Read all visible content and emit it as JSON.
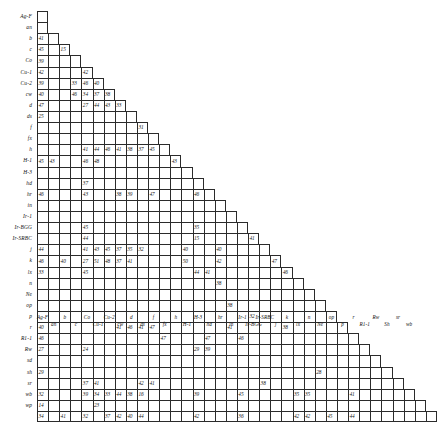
{
  "chart_data": {
    "type": "heatmap",
    "title": "",
    "subtitle": "",
    "xlabel": "",
    "ylabel": "",
    "grid": true,
    "legend": "none",
    "shape": "lower-triangular-staircase",
    "n": 27,
    "note": "Lower-triangular matrix; cell i,j shown only for j <= i. Blank cells carry no value.",
    "labels": [
      "Ag-F",
      "an",
      "b",
      "c",
      "Co",
      "Cu-1",
      "Cu-2",
      "cw",
      "d",
      "ds",
      "f",
      "fx",
      "h",
      "H-1",
      "H-3",
      "hd",
      "hr",
      "in",
      "Ir-1",
      "Ir-BGG",
      "Ir-SRBC",
      "j",
      "k",
      "lx",
      "n",
      "Ne",
      "op"
    ],
    "row_labels": [
      "Ag-F",
      "an",
      "b",
      "c",
      "Co",
      "Cu-1",
      "Cu-2",
      "cw",
      "d",
      "ds",
      "f",
      "fx",
      "h",
      "H-1",
      "H-3",
      "hd",
      "hr",
      "in",
      "Ir-1",
      "Ir-BGG",
      "Ir-SRBC",
      "j",
      "k",
      "lx",
      "n",
      "Ne",
      "op",
      "p",
      "r",
      "R1-1",
      "Rw",
      "sd",
      "sh",
      "sr",
      "wb",
      "wp"
    ],
    "col_labels": [
      "Ag-F",
      "an",
      "b",
      "c",
      "Co",
      "Cu-1",
      "Cu-2",
      "cw",
      "d",
      "ds",
      "f",
      "fx",
      "h",
      "H-1",
      "H-3",
      "hd",
      "hr",
      "in",
      "Ir-1",
      "Ir-BGG",
      "Ir-SRBC",
      "j",
      "k",
      "lx",
      "n",
      "Ne",
      "op",
      "p",
      "r",
      "R1-1",
      "Rw",
      "Sh",
      "sr",
      "wb"
    ],
    "rows": [
      {
        "label": "Ag-F",
        "width": 1,
        "values": [
          null
        ]
      },
      {
        "label": "an",
        "width": 1,
        "values": [
          null
        ]
      },
      {
        "label": "b",
        "width": 2,
        "values": [
          41,
          null
        ]
      },
      {
        "label": "c",
        "width": 3,
        "values": [
          45,
          null,
          15
        ]
      },
      {
        "label": "Co",
        "width": 4,
        "values": [
          39,
          null,
          null,
          null
        ]
      },
      {
        "label": "Cu-1",
        "width": 5,
        "values": [
          42,
          null,
          null,
          null,
          42
        ]
      },
      {
        "label": "Cu-2",
        "width": 6,
        "values": [
          39,
          null,
          null,
          33,
          46,
          40
        ]
      },
      {
        "label": "cw",
        "width": 7,
        "values": [
          40,
          null,
          null,
          46,
          34,
          37,
          38
        ]
      },
      {
        "label": "d",
        "width": 8,
        "values": [
          47,
          null,
          null,
          null,
          27,
          44,
          43,
          33
        ]
      },
      {
        "label": "ds",
        "width": 9,
        "values": [
          25,
          null,
          null,
          null,
          null,
          null,
          null,
          null,
          null
        ]
      },
      {
        "label": "f",
        "width": 10,
        "values": [
          null,
          null,
          null,
          null,
          null,
          null,
          null,
          null,
          null,
          31
        ]
      },
      {
        "label": "fx",
        "width": 11,
        "values": [
          null,
          null,
          null,
          null,
          null,
          null,
          null,
          null,
          null,
          null,
          null
        ]
      },
      {
        "label": "h",
        "width": 12,
        "values": [
          null,
          null,
          null,
          null,
          41,
          44,
          46,
          41,
          38,
          37,
          45,
          null
        ]
      },
      {
        "label": "H-1",
        "width": 13,
        "values": [
          45,
          43,
          null,
          null,
          46,
          48,
          null,
          null,
          null,
          null,
          null,
          null,
          43
        ]
      },
      {
        "label": "H-3",
        "width": 14,
        "values": [
          null,
          null,
          null,
          null,
          null,
          null,
          null,
          null,
          null,
          null,
          null,
          null,
          null,
          null
        ]
      },
      {
        "label": "hd",
        "width": 15,
        "values": [
          null,
          null,
          null,
          null,
          37,
          null,
          null,
          null,
          null,
          null,
          null,
          null,
          null,
          null,
          null
        ]
      },
      {
        "label": "hr",
        "width": 16,
        "values": [
          46,
          null,
          null,
          null,
          43,
          null,
          null,
          38,
          39,
          null,
          47,
          null,
          null,
          null,
          46,
          null
        ]
      },
      {
        "label": "in",
        "width": 17,
        "values": [
          null,
          null,
          null,
          null,
          null,
          null,
          null,
          null,
          null,
          null,
          null,
          null,
          null,
          null,
          null,
          null,
          null
        ]
      },
      {
        "label": "Ir-1",
        "width": 18,
        "values": [
          null,
          null,
          null,
          null,
          null,
          null,
          null,
          null,
          null,
          null,
          null,
          null,
          null,
          null,
          null,
          null,
          null,
          null
        ]
      },
      {
        "label": "Ir-BGG",
        "width": 19,
        "values": [
          null,
          null,
          null,
          null,
          45,
          null,
          null,
          null,
          null,
          null,
          null,
          null,
          null,
          null,
          35,
          null,
          null,
          null,
          null
        ]
      },
      {
        "label": "Ir-SRBC",
        "width": 20,
        "values": [
          null,
          null,
          null,
          null,
          44,
          null,
          null,
          null,
          null,
          null,
          null,
          null,
          null,
          null,
          15,
          null,
          null,
          null,
          null,
          41
        ]
      },
      {
        "label": "j",
        "width": 21,
        "values": [
          44,
          null,
          null,
          null,
          41,
          43,
          45,
          37,
          35,
          32,
          null,
          null,
          null,
          40,
          null,
          null,
          40,
          null,
          null,
          null,
          null
        ]
      },
      {
        "label": "k",
        "width": 22,
        "values": [
          46,
          null,
          40,
          null,
          27,
          51,
          48,
          37,
          41,
          null,
          null,
          null,
          null,
          50,
          null,
          null,
          42,
          null,
          null,
          null,
          null,
          47
        ]
      },
      {
        "label": "lx",
        "width": 23,
        "values": [
          33,
          null,
          null,
          null,
          45,
          null,
          null,
          null,
          null,
          null,
          null,
          null,
          null,
          null,
          44,
          41,
          null,
          null,
          null,
          null,
          null,
          null,
          46
        ]
      },
      {
        "label": "n",
        "width": 24,
        "values": [
          null,
          null,
          null,
          null,
          null,
          null,
          null,
          null,
          null,
          null,
          null,
          null,
          null,
          null,
          null,
          null,
          38,
          null,
          null,
          null,
          null,
          null,
          null,
          null
        ]
      },
      {
        "label": "Ne",
        "width": 25,
        "values": [
          null,
          null,
          null,
          null,
          null,
          null,
          null,
          null,
          null,
          null,
          null,
          null,
          null,
          null,
          null,
          null,
          null,
          null,
          null,
          null,
          null,
          null,
          null,
          null,
          null
        ]
      },
      {
        "label": "op",
        "width": 26,
        "values": [
          null,
          null,
          null,
          null,
          null,
          null,
          null,
          null,
          null,
          null,
          null,
          null,
          null,
          null,
          null,
          null,
          null,
          38,
          null,
          null,
          null,
          null,
          null,
          null,
          null,
          null
        ]
      },
      {
        "label": "p",
        "width": 27,
        "values": [
          null,
          null,
          null,
          null,
          null,
          null,
          null,
          null,
          null,
          null,
          null,
          null,
          null,
          null,
          null,
          null,
          null,
          null,
          null,
          32,
          null,
          null,
          null,
          null,
          null,
          null,
          null
        ]
      },
      {
        "label": "r",
        "width": 28,
        "values": [
          40,
          null,
          null,
          null,
          null,
          null,
          null,
          41,
          46,
          41,
          47,
          null,
          null,
          null,
          null,
          null,
          null,
          41,
          null,
          null,
          null,
          null,
          38,
          null,
          null,
          null,
          null,
          null
        ]
      },
      {
        "label": "R1-1",
        "width": 29,
        "values": [
          46,
          null,
          null,
          null,
          null,
          null,
          null,
          null,
          null,
          null,
          null,
          47,
          null,
          null,
          null,
          47,
          null,
          null,
          46,
          null,
          null,
          null,
          null,
          null,
          null,
          null,
          null,
          null,
          null
        ]
      },
      {
        "label": "Rw",
        "width": 30,
        "values": [
          27,
          null,
          null,
          null,
          24,
          null,
          null,
          null,
          null,
          null,
          null,
          null,
          null,
          null,
          29,
          39,
          null,
          null,
          null,
          null,
          null,
          null,
          null,
          null,
          null,
          null,
          null,
          null,
          null,
          null
        ]
      },
      {
        "label": "sd",
        "width": 31,
        "values": [
          null,
          null,
          null,
          null,
          null,
          null,
          null,
          null,
          null,
          null,
          null,
          null,
          null,
          null,
          null,
          null,
          null,
          null,
          null,
          null,
          null,
          null,
          null,
          null,
          null,
          null,
          null,
          null,
          null,
          null,
          null
        ]
      },
      {
        "label": "sh",
        "width": 32,
        "values": [
          29,
          null,
          null,
          null,
          null,
          null,
          null,
          null,
          null,
          null,
          null,
          null,
          null,
          null,
          null,
          null,
          null,
          null,
          null,
          null,
          null,
          null,
          null,
          null,
          null,
          28,
          null,
          null,
          null,
          null,
          null,
          null
        ]
      },
      {
        "label": "sr",
        "width": 33,
        "values": [
          null,
          null,
          null,
          null,
          37,
          41,
          null,
          null,
          null,
          42,
          41,
          null,
          null,
          null,
          null,
          null,
          null,
          null,
          null,
          null,
          38,
          null,
          null,
          null,
          null,
          null,
          null,
          null,
          null,
          null,
          null,
          null,
          null
        ]
      },
      {
        "label": "wb",
        "width": 34,
        "values": [
          32,
          null,
          null,
          null,
          39,
          34,
          33,
          44,
          38,
          16,
          null,
          null,
          null,
          null,
          39,
          null,
          null,
          null,
          45,
          null,
          null,
          null,
          null,
          35,
          35,
          null,
          null,
          null,
          41,
          null,
          null,
          null,
          null,
          null
        ]
      },
      {
        "label": "wp",
        "width": 35,
        "values": [
          14,
          null,
          null,
          null,
          null,
          23,
          null,
          null,
          null,
          null,
          null,
          null,
          null,
          null,
          null,
          null,
          null,
          null,
          null,
          null,
          null,
          null,
          null,
          null,
          null,
          null,
          null,
          null,
          null,
          null,
          null,
          null,
          null,
          null,
          null
        ]
      },
      {
        "label": "",
        "width": 36,
        "values": [
          34,
          null,
          41,
          null,
          32,
          null,
          37,
          42,
          40,
          44,
          null,
          null,
          null,
          null,
          42,
          null,
          null,
          null,
          36,
          null,
          null,
          null,
          null,
          42,
          42,
          null,
          45,
          null,
          44,
          null,
          null,
          null,
          null,
          null,
          null,
          null
        ]
      }
    ]
  }
}
